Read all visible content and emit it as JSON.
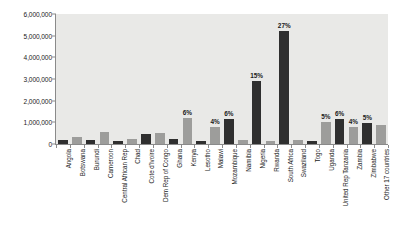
{
  "chart_data": {
    "type": "bar",
    "title": "",
    "subtitle": "",
    "xlabel": "",
    "ylabel": "",
    "ylim": [
      0,
      6000000
    ],
    "grid": false,
    "legend": "none",
    "y_ticks": [
      "0",
      "1,000,000",
      "2,000,000",
      "3,000,000",
      "4,000,000",
      "5,000,000",
      "6,000,000"
    ],
    "y_tick_values": [
      0,
      1000000,
      2000000,
      3000000,
      4000000,
      5000000,
      6000000
    ],
    "categories": [
      "Angola",
      "Botswana",
      "Burundi",
      "Cameroon",
      "Central African Rep",
      "Chad",
      "Cote d'Ivoire",
      "Dem Rep of Congo",
      "Ghana",
      "Kenya",
      "Lesotho",
      "Malawi",
      "Mozambique",
      "Namibia",
      "Nigeria",
      "Rwanda",
      "South Africa",
      "Swaziland",
      "Togo",
      "Uganda",
      "United Rep Tanzania",
      "Zambia",
      "Zimbabwe",
      "Other 17 countries"
    ],
    "values": [
      180000,
      330000,
      180000,
      540000,
      120000,
      230000,
      480000,
      520000,
      230000,
      1200000,
      140000,
      800000,
      1150000,
      180000,
      2900000,
      120000,
      5200000,
      200000,
      130000,
      1000000,
      1150000,
      800000,
      980000,
      900000
    ],
    "bar_colors": [
      "dark",
      "light",
      "dark",
      "light",
      "dark",
      "light",
      "dark",
      "light",
      "dark",
      "light",
      "dark",
      "light",
      "dark",
      "light",
      "dark",
      "light",
      "dark",
      "light",
      "dark",
      "light",
      "dark",
      "light",
      "dark",
      "light"
    ],
    "data_labels": [
      "",
      "",
      "",
      "",
      "",
      "",
      "",
      "",
      "",
      "6%",
      "",
      "4%",
      "6%",
      "",
      "15%",
      "",
      "27%",
      "",
      "",
      "5%",
      "6%",
      "4%",
      "5%",
      ""
    ],
    "palette": {
      "bar_dark": "#2f2f2f",
      "bar_light": "#9d9d9b",
      "plot_background": "#e9e9e7",
      "axis": "#8a8a8a",
      "text": "#1a1a1a",
      "page_background": "#ffffff"
    }
  }
}
